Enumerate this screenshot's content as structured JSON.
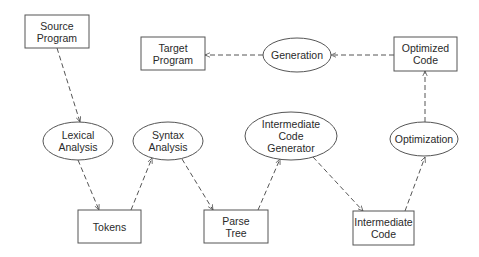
{
  "diagram": {
    "type": "flowchart",
    "title": "",
    "nodes": [
      {
        "id": "source_program",
        "shape": "rect",
        "lines": [
          "Source",
          "Program"
        ],
        "x": 25,
        "y": 15,
        "w": 64,
        "h": 33
      },
      {
        "id": "lexical_analysis",
        "shape": "ellipse",
        "lines": [
          "Lexical",
          "Analysis"
        ],
        "cx": 78,
        "cy": 141,
        "rx": 35,
        "ry": 19
      },
      {
        "id": "tokens",
        "shape": "rect",
        "lines": [
          "Tokens"
        ],
        "x": 78,
        "y": 210,
        "w": 63,
        "h": 33
      },
      {
        "id": "syntax_analysis",
        "shape": "ellipse",
        "lines": [
          "Syntax",
          "Analysis"
        ],
        "cx": 168,
        "cy": 141,
        "rx": 35,
        "ry": 19
      },
      {
        "id": "parse_tree",
        "shape": "rect",
        "lines": [
          "Parse",
          "Tree"
        ],
        "x": 204,
        "y": 210,
        "w": 64,
        "h": 33
      },
      {
        "id": "intermediate_code_generator",
        "shape": "ellipse",
        "lines": [
          "Intermediate",
          "Code",
          "Generator"
        ],
        "cx": 291,
        "cy": 136,
        "rx": 46,
        "ry": 24
      },
      {
        "id": "intermediate_code",
        "shape": "rect",
        "lines": [
          "Intermediate",
          "Code"
        ],
        "x": 353,
        "y": 211,
        "w": 61,
        "h": 34
      },
      {
        "id": "optimization",
        "shape": "ellipse",
        "lines": [
          "Optimization"
        ],
        "cx": 424,
        "cy": 139,
        "rx": 34,
        "ry": 17
      },
      {
        "id": "optimized_code",
        "shape": "rect",
        "lines": [
          "Optimized",
          "Code"
        ],
        "x": 394,
        "y": 37,
        "w": 63,
        "h": 34
      },
      {
        "id": "generation",
        "shape": "ellipse",
        "lines": [
          "Generation"
        ],
        "cx": 297,
        "cy": 55,
        "rx": 34,
        "ry": 17
      },
      {
        "id": "target_program",
        "shape": "rect",
        "lines": [
          "Target",
          "Program"
        ],
        "x": 141,
        "y": 37,
        "w": 64,
        "h": 33
      }
    ],
    "edges": [
      {
        "from": "source_program",
        "to": "lexical_analysis",
        "x1": 57,
        "y1": 48,
        "x2": 80,
        "y2": 122,
        "style": "dashed"
      },
      {
        "from": "lexical_analysis",
        "to": "tokens",
        "x1": 78,
        "y1": 160,
        "x2": 99,
        "y2": 210,
        "style": "dashed"
      },
      {
        "from": "tokens",
        "to": "syntax_analysis",
        "x1": 131,
        "y1": 210,
        "x2": 152,
        "y2": 158,
        "style": "dashed"
      },
      {
        "from": "syntax_analysis",
        "to": "parse_tree",
        "x1": 182,
        "y1": 159,
        "x2": 213,
        "y2": 210,
        "style": "dashed"
      },
      {
        "from": "parse_tree",
        "to": "intermediate_code_generator",
        "x1": 258,
        "y1": 210,
        "x2": 280,
        "y2": 159,
        "style": "dashed"
      },
      {
        "from": "intermediate_code_generator",
        "to": "intermediate_code",
        "x1": 313,
        "y1": 157,
        "x2": 363,
        "y2": 211,
        "style": "dashed"
      },
      {
        "from": "intermediate_code",
        "to": "optimization",
        "x1": 405,
        "y1": 211,
        "x2": 425,
        "y2": 157,
        "style": "dashed"
      },
      {
        "from": "optimization",
        "to": "optimized_code",
        "x1": 425,
        "y1": 122,
        "x2": 425,
        "y2": 71,
        "style": "dashed"
      },
      {
        "from": "optimized_code",
        "to": "generation",
        "x1": 394,
        "y1": 55,
        "x2": 331,
        "y2": 55,
        "style": "dashed"
      },
      {
        "from": "generation",
        "to": "target_program",
        "x1": 263,
        "y1": 55,
        "x2": 205,
        "y2": 55,
        "style": "dashed"
      }
    ]
  },
  "colors": {
    "stroke": "#555555",
    "text": "#2a2a2a",
    "background": "#ffffff"
  }
}
